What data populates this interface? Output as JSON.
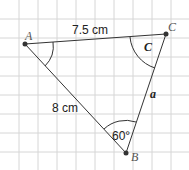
{
  "diagram": {
    "type": "triangle-on-grid",
    "vertices": {
      "A": {
        "label": "A",
        "x": 25,
        "y": 44
      },
      "B": {
        "label": "B",
        "x": 126,
        "y": 153
      },
      "C": {
        "label": "C",
        "x": 166,
        "y": 34
      }
    },
    "sides": {
      "AC": {
        "label": "7.5 cm"
      },
      "AB": {
        "label": "8 cm"
      },
      "BC": {
        "label": "a"
      }
    },
    "angles": {
      "C": {
        "label": "C"
      },
      "B": {
        "label": "60°"
      },
      "A": {
        "label": ""
      }
    },
    "colors": {
      "grid": "#d6d6d6",
      "line": "#333333",
      "background": "#ffffff"
    }
  }
}
